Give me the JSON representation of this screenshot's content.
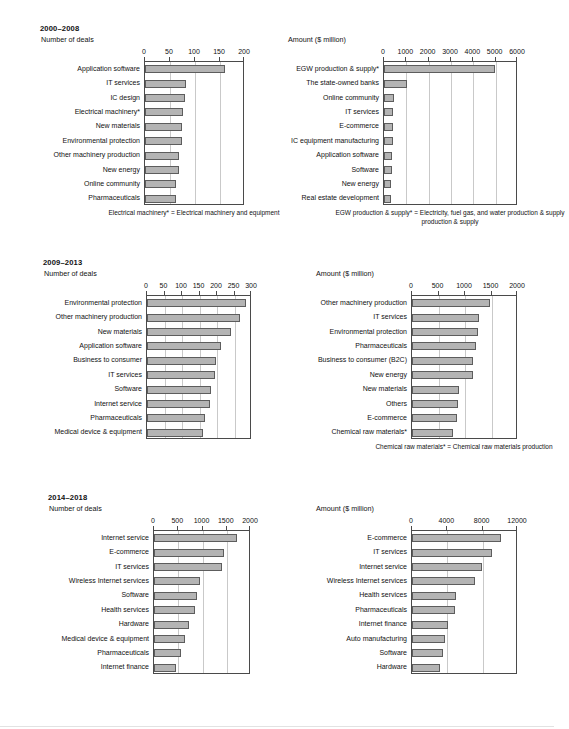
{
  "chart_data": [
    {
      "type": "bar",
      "orientation": "horizontal",
      "panel": "2000-2008 / Number of deals",
      "title": "2000–2008",
      "subtitle": "Number of deals",
      "xlabel": "",
      "ylabel": "",
      "xlim": [
        0,
        200
      ],
      "xticks": [
        0,
        50,
        100,
        150,
        200
      ],
      "grid": true,
      "categories": [
        "Application software",
        "IT services",
        "IC design",
        "Electrical machinery*",
        "New materials",
        "Environmental protection",
        "Other machinery production",
        "New energy",
        "Online community",
        "Pharmaceuticals"
      ],
      "values": [
        160,
        81,
        80,
        76,
        74,
        73,
        68,
        67,
        62,
        61
      ],
      "footnote": "Electrical machinery* = Electrical machinery and equipment"
    },
    {
      "type": "bar",
      "orientation": "horizontal",
      "panel": "2000-2008 / Amount ($ million)",
      "title": "2000–2008",
      "subtitle": "Amount ($ million)",
      "xlabel": "",
      "ylabel": "",
      "xlim": [
        0,
        6000
      ],
      "xticks": [
        0,
        1000,
        2000,
        3000,
        4000,
        5000,
        6000
      ],
      "grid": true,
      "categories": [
        "EGW production & supply*",
        "The state-owned banks",
        "Online community",
        "IT services",
        "E-commerce",
        "IC equipment manufacturing",
        "Application software",
        "Software",
        "New energy",
        "Real estate development"
      ],
      "values": [
        4950,
        1030,
        430,
        420,
        400,
        390,
        370,
        360,
        330,
        320
      ],
      "footnote": "EGW production & supply* = Electricity, fuel gas, and water production & supply"
    },
    {
      "type": "bar",
      "orientation": "horizontal",
      "panel": "2009-2013 / Number of deals",
      "title": "2009–2013",
      "subtitle": "Number of deals",
      "xlabel": "",
      "ylabel": "",
      "xlim": [
        0,
        300
      ],
      "xticks": [
        0,
        50,
        100,
        150,
        200,
        250,
        300
      ],
      "grid": true,
      "categories": [
        "Environmental protection",
        "Other machinery production",
        "New materials",
        "Application software",
        "Business to consumer",
        "IT services",
        "Software",
        "Internet service",
        "Pharmaceuticals",
        "Medical device & equipment"
      ],
      "values": [
        283,
        266,
        241,
        212,
        196,
        193,
        183,
        180,
        167,
        161
      ],
      "footnote": ""
    },
    {
      "type": "bar",
      "orientation": "horizontal",
      "panel": "2009-2013 / Amount ($ million)",
      "title": "2009–2013",
      "subtitle": "Amount ($ million)",
      "xlabel": "",
      "ylabel": "",
      "xlim": [
        0,
        2000
      ],
      "xticks": [
        0,
        500,
        1000,
        1500,
        2000
      ],
      "grid": true,
      "categories": [
        "Other machinery production",
        "IT services",
        "Environmental protection",
        "Pharmaceuticals",
        "Business to consumer (B2C)",
        "New energy",
        "New materials",
        "Others",
        "E-commerce",
        "Chemical raw materials*"
      ],
      "values": [
        1470,
        1260,
        1240,
        1200,
        1160,
        1150,
        880,
        860,
        840,
        770
      ],
      "footnote": "Chemical raw materials* = Chemical raw materials production"
    },
    {
      "type": "bar",
      "orientation": "horizontal",
      "panel": "2014-2018 / Number of deals",
      "title": "2014–2018",
      "subtitle": "Number of deals",
      "xlabel": "",
      "ylabel": "",
      "xlim": [
        0,
        2000
      ],
      "xticks": [
        0,
        500,
        1000,
        1500,
        2000
      ],
      "grid": true,
      "categories": [
        "Internet service",
        "E-commerce",
        "IT services",
        "Wireless Internet services",
        "Software",
        "Health services",
        "Hardware",
        "Medical device & equipment",
        "Pharmaceuticals",
        "Internet finance"
      ],
      "values": [
        1710,
        1440,
        1410,
        940,
        890,
        840,
        720,
        630,
        550,
        450
      ],
      "footnote": ""
    },
    {
      "type": "bar",
      "orientation": "horizontal",
      "panel": "2014-2018 / Amount ($ million)",
      "title": "2014–2018",
      "subtitle": "Amount ($ million)",
      "xlabel": "",
      "ylabel": "",
      "xlim": [
        0,
        12000
      ],
      "xticks": [
        0,
        4000,
        8000,
        12000
      ],
      "grid": true,
      "categories": [
        "E-commerce",
        "IT services",
        "Internet service",
        "Wireless Internet services",
        "Health services",
        "Pharmaceuticals",
        "Internet finance",
        "Auto manufacturing",
        "Software",
        "Hardware"
      ],
      "values": [
        10100,
        9100,
        7900,
        7100,
        4950,
        4900,
        4100,
        3700,
        3500,
        3150
      ],
      "footnote": ""
    }
  ],
  "periods": [
    {
      "title": "2000–2008",
      "left": {
        "subtitle": "Number of deals",
        "ticks": [
          "0",
          "50",
          "100",
          "150",
          "200"
        ],
        "categories": [
          "Application software",
          "IT services",
          "IC design",
          "Electrical machinery*",
          "New materials",
          "Environmental protection",
          "Other machinery production",
          "New energy",
          "Online community",
          "Pharmaceuticals"
        ],
        "footnote": "Electrical machinery* = Electrical machinery and equipment"
      },
      "right": {
        "subtitle": "Amount ($ million)",
        "ticks": [
          "0",
          "1000",
          "2000",
          "3000",
          "4000",
          "5000",
          "6000"
        ],
        "categories": [
          "EGW production & supply*",
          "The state-owned banks",
          "Online community",
          "IT services",
          "E-commerce",
          "IC equipment manufacturing",
          "Application software",
          "Software",
          "New energy",
          "Real estate development"
        ],
        "footnote": "EGW production & supply* = Electricity, fuel gas, and water",
        "footnote2": "production & supply"
      }
    },
    {
      "title": "2009–2013",
      "left": {
        "subtitle": "Number of deals",
        "ticks": [
          "0",
          "50",
          "100",
          "150",
          "200",
          "250",
          "300"
        ],
        "categories": [
          "Environmental protection",
          "Other machinery production",
          "New materials",
          "Application software",
          "Business to consumer",
          "IT services",
          "Software",
          "Internet service",
          "Pharmaceuticals",
          "Medical device & equipment"
        ],
        "footnote": ""
      },
      "right": {
        "subtitle": "Amount ($ million)",
        "ticks": [
          "0",
          "500",
          "1000",
          "1500",
          "2000"
        ],
        "categories": [
          "Other machinery production",
          "IT services",
          "Environmental protection",
          "Pharmaceuticals",
          "Business to consumer (B2C)",
          "New energy",
          "New materials",
          "Others",
          "E-commerce",
          "Chemical raw materials*"
        ],
        "footnote": "Chemical raw materials* = Chemical raw materials production",
        "footnote2": ""
      }
    },
    {
      "title": "2014–2018",
      "left": {
        "subtitle": "Number of deals",
        "ticks": [
          "0",
          "500",
          "1000",
          "1500",
          "2000"
        ],
        "categories": [
          "Internet service",
          "E-commerce",
          "IT services",
          "Wireless Internet services",
          "Software",
          "Health services",
          "Hardware",
          "Medical device & equipment",
          "Pharmaceuticals",
          "Internet finance"
        ],
        "footnote": ""
      },
      "right": {
        "subtitle": "Amount ($ million)",
        "ticks": [
          "0",
          "4000",
          "8000",
          "12000"
        ],
        "categories": [
          "E-commerce",
          "IT services",
          "Internet service",
          "Wireless Internet services",
          "Health services",
          "Pharmaceuticals",
          "Internet finance",
          "Auto manufacturing",
          "Software",
          "Hardware"
        ],
        "footnote": "",
        "footnote2": ""
      }
    }
  ],
  "style": {
    "bar_fill": "#b4b4b4",
    "bar_stroke": "#5d5d5d",
    "grid_color": "#c9c9c9",
    "axis_color": "#4a4a4a",
    "text_color": "#111111"
  }
}
